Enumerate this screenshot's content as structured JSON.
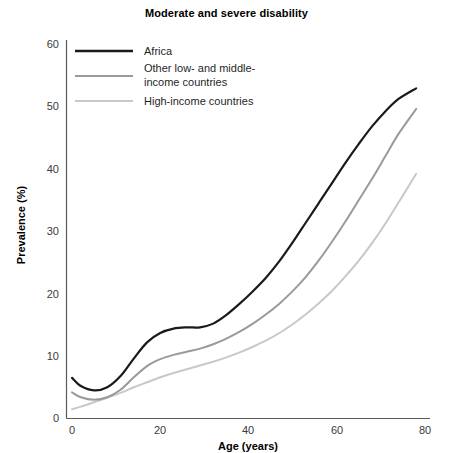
{
  "chart_data": {
    "type": "line",
    "title": "Moderate and severe disability",
    "xlabel": "Age (years)",
    "ylabel": "Prevalence (%)",
    "xlim": [
      -2,
      82
    ],
    "ylim": [
      0,
      62
    ],
    "xticks": [
      0,
      20,
      40,
      60,
      80
    ],
    "yticks": [
      0,
      10,
      20,
      30,
      40,
      50,
      60
    ],
    "grid": false,
    "legend_position": "top-left",
    "x": [
      0,
      2,
      5,
      8,
      11,
      14,
      17,
      20,
      23,
      26,
      29,
      32,
      35,
      38,
      41,
      44,
      47,
      50,
      53,
      56,
      59,
      62,
      65,
      68,
      71,
      74,
      78
    ],
    "series": [
      {
        "name": "Africa",
        "color": "#1a1a1a",
        "width": 2.2,
        "values": [
          6.5,
          5.2,
          4.5,
          5.0,
          6.8,
          9.6,
          12.2,
          13.7,
          14.4,
          14.6,
          14.6,
          15.2,
          16.6,
          18.4,
          20.4,
          22.6,
          25.2,
          28.2,
          31.4,
          34.6,
          37.8,
          41.0,
          44.0,
          46.8,
          49.2,
          51.2,
          52.9
        ]
      },
      {
        "name": "Other low- and middle-income countries",
        "color": "#9a9a9a",
        "width": 2.0,
        "values": [
          4.2,
          3.4,
          3.0,
          3.4,
          4.6,
          6.6,
          8.4,
          9.5,
          10.2,
          10.7,
          11.2,
          11.9,
          12.8,
          13.9,
          15.2,
          16.7,
          18.4,
          20.4,
          22.7,
          25.4,
          28.4,
          31.6,
          35.0,
          38.4,
          42.0,
          45.6,
          49.6
        ]
      },
      {
        "name": "High-income countries",
        "color": "#c8c8c8",
        "width": 2.0,
        "values": [
          1.5,
          1.9,
          2.6,
          3.3,
          4.1,
          5.0,
          5.8,
          6.6,
          7.3,
          7.9,
          8.5,
          9.1,
          9.8,
          10.6,
          11.5,
          12.5,
          13.7,
          15.1,
          16.7,
          18.5,
          20.5,
          22.8,
          25.3,
          28.1,
          31.2,
          34.6,
          39.2
        ]
      }
    ],
    "legend": [
      {
        "label": "Africa",
        "color": "#1a1a1a",
        "width": 2.4
      },
      {
        "label_line1": "Other low- and middle-",
        "label_line2": "income countries",
        "color": "#9a9a9a",
        "width": 2.0
      },
      {
        "label": "High-income countries",
        "color": "#c8c8c8",
        "width": 2.0
      }
    ]
  }
}
